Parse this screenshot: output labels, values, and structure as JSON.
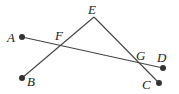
{
  "diagram": {
    "type": "geometry",
    "points": {
      "A": {
        "label": "A",
        "x": 22,
        "y": 37
      },
      "B": {
        "label": "B",
        "x": 22,
        "y": 78
      },
      "C": {
        "label": "C",
        "x": 159,
        "y": 83
      },
      "D": {
        "label": "D",
        "x": 163,
        "y": 68
      },
      "E": {
        "label": "E",
        "x": 94,
        "y": 17
      },
      "F": {
        "label": "F",
        "x": 61,
        "y": 46
      },
      "G": {
        "label": "G",
        "x": 139,
        "y": 64
      }
    },
    "segments": [
      [
        "A",
        "D"
      ],
      [
        "B",
        "E"
      ],
      [
        "E",
        "C"
      ]
    ],
    "endpoints_dotted": [
      "A",
      "B",
      "C",
      "D"
    ],
    "stroke_color": "#444444",
    "dot_color": "#333333"
  }
}
